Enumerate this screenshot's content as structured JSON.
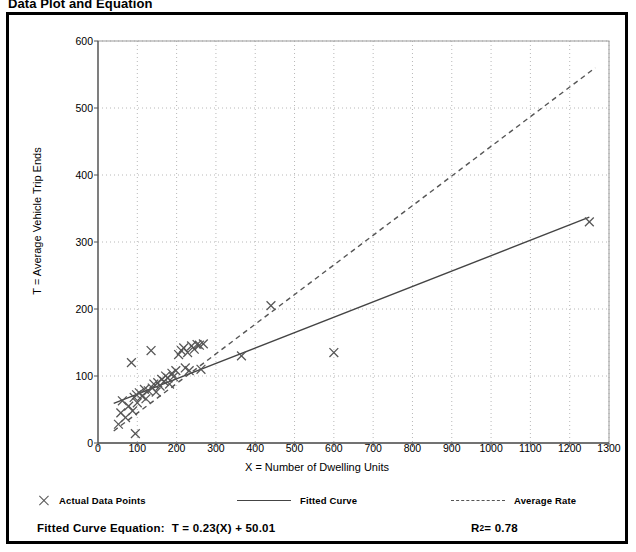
{
  "title": "Data Plot and Equation",
  "axes": {
    "xlabel": "X = Number of Dwelling Units",
    "ylabel": "T = Average Vehicle Trip Ends"
  },
  "legend": {
    "items": [
      {
        "label": "Actual Data Points",
        "marker": "x-marker-icon"
      },
      {
        "label": "Fitted Curve",
        "marker": "solid-line-icon"
      },
      {
        "label": "Average Rate",
        "marker": "dashed-line-icon"
      }
    ]
  },
  "equation": {
    "label": "Fitted Curve Equation:",
    "expression": "T = 0.23(X) + 50.01",
    "r2_prefix": "R",
    "r2_exponent": "2",
    "r2_value": " = 0.78"
  },
  "chart_data": {
    "type": "scatter",
    "title": "Data Plot and Equation",
    "xlabel": "X = Number of Dwelling Units",
    "ylabel": "T = Average Vehicle Trip Ends",
    "xlim": [
      0,
      1300
    ],
    "ylim": [
      0,
      600
    ],
    "xticks": [
      0,
      100,
      200,
      300,
      400,
      500,
      600,
      700,
      800,
      900,
      1000,
      1100,
      1200,
      1300
    ],
    "yticks": [
      0,
      100,
      200,
      300,
      400,
      500,
      600
    ],
    "grid": true,
    "grid_style": "dotted",
    "legend_position": "below-plot",
    "series": [
      {
        "name": "Actual Data Points",
        "type": "scatter",
        "marker": "x",
        "color": "#555555",
        "points": [
          [
            52,
            28
          ],
          [
            58,
            45
          ],
          [
            62,
            63
          ],
          [
            70,
            38
          ],
          [
            78,
            55
          ],
          [
            85,
            120
          ],
          [
            88,
            48
          ],
          [
            92,
            68
          ],
          [
            95,
            14
          ],
          [
            98,
            72
          ],
          [
            100,
            60
          ],
          [
            105,
            75
          ],
          [
            112,
            70
          ],
          [
            118,
            80
          ],
          [
            122,
            66
          ],
          [
            128,
            78
          ],
          [
            135,
            138
          ],
          [
            138,
            82
          ],
          [
            142,
            88
          ],
          [
            148,
            76
          ],
          [
            152,
            90
          ],
          [
            158,
            85
          ],
          [
            162,
            95
          ],
          [
            168,
            92
          ],
          [
            172,
            100
          ],
          [
            178,
            97
          ],
          [
            182,
            88
          ],
          [
            188,
            104
          ],
          [
            192,
            99
          ],
          [
            198,
            108
          ],
          [
            205,
            132
          ],
          [
            212,
            138
          ],
          [
            218,
            142
          ],
          [
            222,
            112
          ],
          [
            228,
            135
          ],
          [
            232,
            108
          ],
          [
            238,
            145
          ],
          [
            245,
            140
          ],
          [
            252,
            147
          ],
          [
            258,
            146
          ],
          [
            262,
            110
          ],
          [
            268,
            148
          ],
          [
            365,
            130
          ],
          [
            440,
            205
          ],
          [
            600,
            135
          ],
          [
            1250,
            330
          ]
        ]
      },
      {
        "name": "Fitted Curve",
        "type": "line",
        "style": "solid",
        "color": "#444444",
        "equation": "T = 0.23(X) + 50.01",
        "slope": 0.23,
        "intercept": 50.01,
        "r_squared": 0.78,
        "x_range": [
          40,
          1250
        ],
        "endpoints": [
          [
            40,
            59
          ],
          [
            1250,
            337
          ]
        ]
      },
      {
        "name": "Average Rate",
        "type": "line",
        "style": "dashed",
        "color": "#555555",
        "slope": 0.4426,
        "intercept": 0,
        "x_range": [
          40,
          1265
        ],
        "endpoints": [
          [
            40,
            18
          ],
          [
            1265,
            560
          ]
        ]
      }
    ]
  }
}
